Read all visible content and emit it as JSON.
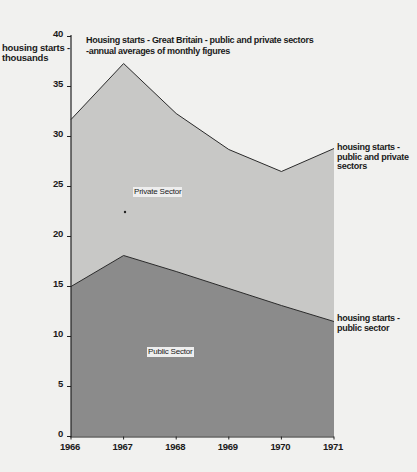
{
  "chart_data": {
    "type": "area",
    "stacked": true,
    "title_lines": [
      "Housing starts - Great Britain - public and private sectors",
      "-annual averages of monthly figures"
    ],
    "ylabel": "housing starts - thousands",
    "ylabel_lines": [
      "housing starts -",
      "thousands"
    ],
    "xlabel": "",
    "x": [
      1966,
      1967,
      1968,
      1969,
      1970,
      1971
    ],
    "ylim": [
      0,
      40
    ],
    "yticks": [
      0,
      5,
      10,
      15,
      20,
      25,
      30,
      35,
      40
    ],
    "grid": false,
    "series": [
      {
        "name": "Public Sector",
        "values": [
          15.0,
          18.1,
          16.5,
          14.8,
          13.1,
          11.5
        ],
        "color": "#8a8a8a"
      },
      {
        "name": "Private Sector",
        "values": [
          16.7,
          19.2,
          15.8,
          13.9,
          13.4,
          17.3
        ],
        "color": "#c8c8c8"
      }
    ],
    "totals": [
      31.7,
      37.3,
      32.3,
      28.7,
      26.5,
      28.8
    ],
    "annotations": [
      {
        "text": "housing starts - public and private sectors",
        "lines": [
          "housing starts -",
          "public and private",
          "sectors"
        ],
        "attached_to": "total",
        "at": 1971
      },
      {
        "text": "housing starts - public sector",
        "lines": [
          "housing starts -",
          "public sector"
        ],
        "attached_to": "Public Sector",
        "at": 1971
      }
    ],
    "area_labels": [
      "Private Sector",
      "Public Sector"
    ]
  }
}
